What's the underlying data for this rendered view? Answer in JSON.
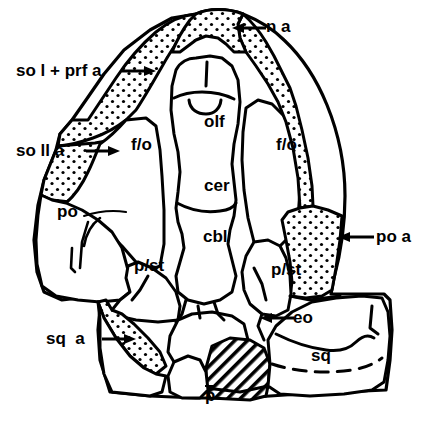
{
  "figure": {
    "background_color": "#ffffff",
    "ink_color": "#000000",
    "stipple_fill_note": "dotted (stippled) shading",
    "hatch_fill_note": "diagonal line hatching"
  },
  "labels": {
    "external": [
      {
        "id": "na",
        "text": "n a",
        "arrow": "left",
        "x": 266,
        "y": 18,
        "arrow_from_x": 262,
        "arrow_from_y": 27,
        "arrow_to_x": 236,
        "arrow_to_y": 27
      },
      {
        "id": "so1prfa",
        "text": "so l + prf a",
        "arrow": "right",
        "x": 16,
        "y": 62,
        "arrow_from_x": 122,
        "arrow_from_y": 70,
        "arrow_to_x": 152,
        "arrow_to_y": 70
      },
      {
        "id": "so2a",
        "text": "so ll a",
        "arrow": "right",
        "x": 16,
        "y": 142,
        "arrow_from_x": 87,
        "arrow_from_y": 150,
        "arrow_to_x": 117,
        "arrow_to_y": 150
      },
      {
        "id": "poa",
        "text": "po a",
        "arrow": "left",
        "x": 376,
        "y": 228,
        "arrow_from_x": 372,
        "arrow_from_y": 236,
        "arrow_to_x": 340,
        "arrow_to_y": 236
      },
      {
        "id": "sqa",
        "text": "sq  a",
        "arrow": "right",
        "x": 46,
        "y": 330,
        "arrow_from_x": 104,
        "arrow_from_y": 338,
        "arrow_to_x": 132,
        "arrow_to_y": 338
      },
      {
        "id": "eo",
        "text": "eo",
        "arrow": "left",
        "x": 293,
        "y": 309,
        "arrow_from_x": 289,
        "arrow_from_y": 317,
        "arrow_to_x": 263,
        "arrow_to_y": 317
      }
    ],
    "internal": [
      {
        "id": "olf",
        "text": "olf",
        "x": 204,
        "y": 113
      },
      {
        "id": "cer",
        "text": "cer",
        "x": 204,
        "y": 177
      },
      {
        "id": "cbl",
        "text": "cbl",
        "x": 203,
        "y": 228
      },
      {
        "id": "fo-left",
        "text": "f/o",
        "x": 131,
        "y": 136
      },
      {
        "id": "fo-right",
        "text": "f/o",
        "x": 276,
        "y": 136
      },
      {
        "id": "po",
        "text": "po",
        "x": 57,
        "y": 203
      },
      {
        "id": "pst-left",
        "text": "p/st",
        "x": 134,
        "y": 257
      },
      {
        "id": "pst-right",
        "text": "p/st",
        "x": 271,
        "y": 261
      },
      {
        "id": "sq",
        "text": "sq",
        "x": 311,
        "y": 347
      },
      {
        "id": "p",
        "text": "p",
        "x": 188,
        "y": 371,
        "overline": true
      }
    ]
  },
  "legend_keys": [
    {
      "abbr": "n a",
      "meaning": "nasal area"
    },
    {
      "abbr": "so l",
      "meaning": "supraorbital one"
    },
    {
      "abbr": "prf a",
      "meaning": "prefrontal area"
    },
    {
      "abbr": "so ll",
      "meaning": "supraorbital two area"
    },
    {
      "abbr": "po a",
      "meaning": "postorbital area"
    },
    {
      "abbr": "sq a",
      "meaning": "squamosal area"
    },
    {
      "abbr": "eo",
      "meaning": "exoccipital"
    },
    {
      "abbr": "olf",
      "meaning": "olfactory region"
    },
    {
      "abbr": "cer",
      "meaning": "cerebrum"
    },
    {
      "abbr": "cbl",
      "meaning": "cerebellum"
    },
    {
      "abbr": "f/o",
      "meaning": "frontal / orbital"
    },
    {
      "abbr": "po",
      "meaning": "postorbital"
    },
    {
      "abbr": "p/st",
      "meaning": "parietal / supratemporal"
    },
    {
      "abbr": "sq",
      "meaning": "squamosal"
    },
    {
      "abbr": "p",
      "meaning": "parietal"
    }
  ]
}
